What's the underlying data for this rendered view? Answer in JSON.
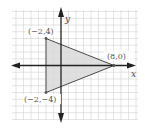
{
  "figure": {
    "axes": {
      "x_label": "x",
      "y_label": "y"
    },
    "vertices": [
      {
        "label": "(−2,4)",
        "x": -2,
        "y": 4
      },
      {
        "label": "(8,0)",
        "x": 8,
        "y": 0
      },
      {
        "label": "(−2,−4)",
        "x": -2,
        "y": -4
      }
    ],
    "colors": {
      "grid": "#cfcfcf",
      "axis": "#222222",
      "triangle_fill": "#dcdcdc",
      "triangle_stroke": "#444444",
      "text": "#555555"
    }
  }
}
